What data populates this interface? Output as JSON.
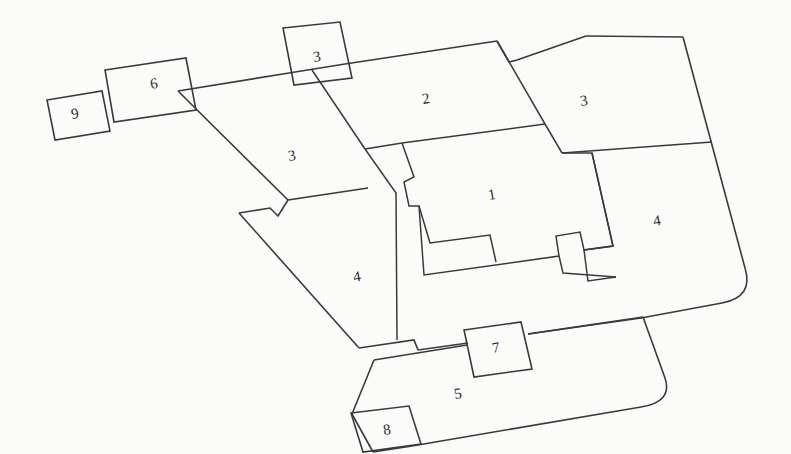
{
  "diagram": {
    "type": "architectural-floor-plan",
    "orientation_deg": -9.5,
    "background_color": "#fbfbf9",
    "line_color": "#3a3a3a",
    "label_color": "#2b2b2b",
    "canvas": {
      "width": 791,
      "height": 454
    }
  },
  "rooms": [
    {
      "id": "zone-9",
      "label": "9",
      "shape": "parallelogram",
      "position": "far-left-outer",
      "x": 75,
      "y": 114
    },
    {
      "id": "zone-6",
      "label": "6",
      "shape": "parallelogram",
      "position": "upper-left-outer",
      "x": 154,
      "y": 84
    },
    {
      "id": "zone-3-top",
      "label": "3",
      "shape": "parallelogram",
      "position": "top-center-small",
      "x": 317,
      "y": 57
    },
    {
      "id": "zone-2",
      "label": "2",
      "shape": "quadrilateral",
      "position": "top-center-large",
      "x": 426,
      "y": 99
    },
    {
      "id": "zone-3-right",
      "label": "3",
      "shape": "quadrilateral",
      "position": "top-right",
      "x": 584,
      "y": 101
    },
    {
      "id": "zone-3-left",
      "label": "3",
      "shape": "polygon",
      "position": "upper-left-interior",
      "x": 292,
      "y": 156
    },
    {
      "id": "zone-1",
      "label": "1",
      "shape": "polygon",
      "position": "center-core",
      "x": 492,
      "y": 195
    },
    {
      "id": "zone-4-right",
      "label": "4",
      "shape": "polygon",
      "position": "right-interior",
      "x": 657,
      "y": 221
    },
    {
      "id": "zone-4-left",
      "label": "4",
      "shape": "polygon",
      "position": "lower-left-interior",
      "x": 357,
      "y": 277
    },
    {
      "id": "zone-7",
      "label": "7",
      "shape": "parallelogram",
      "position": "lower-center-connector",
      "x": 496,
      "y": 348
    },
    {
      "id": "zone-5",
      "label": "5",
      "shape": "polygon",
      "position": "bottom-wing",
      "x": 458,
      "y": 394
    },
    {
      "id": "zone-8",
      "label": "8",
      "shape": "parallelogram",
      "position": "bottom-left-outer",
      "x": 387,
      "y": 430
    }
  ],
  "geometry": {
    "outer_boundary": "M 198,87 L 495,41 L 585,36 L 683,36 L 741,265 q 6,30 -22,36 L 637,318 L 430,358 L 412,348 L 397,340 L 357,347 L 236,213 L 267,207 L 275,212 L 283,198 L 198,87 Z",
    "outer_boundary_note": "Main building perimeter: tilted roughly -9.5 degrees, with one large rounded corner on the right side",
    "bottom_wing": "M 370,361 L 403,354 L 460,345 L 530,333 L 640,317 L 661,376 q 7,25 -24,30 L 410,444 L 374,451 L 370,361 Z",
    "bottom_wing_note": "Lower wing containing zone 5, with rounded right corner",
    "rounded_corners": 2
  },
  "style_notes": {
    "stroke_width_px": 1.6,
    "fill": "none",
    "label_font_size_px": 15
  }
}
